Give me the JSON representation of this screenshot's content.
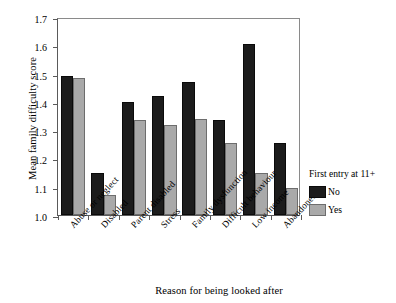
{
  "chart_data": {
    "type": "bar",
    "title": "",
    "xlabel": "Reason for being looked after",
    "ylabel": "Mean family difficulty score",
    "ylim": [
      1.0,
      1.7
    ],
    "yticks": [
      "1.0",
      "1.1",
      "1.2",
      "1.3",
      "1.4",
      "1.5",
      "1.6",
      "1.7"
    ],
    "grid": false,
    "legend_position": "right",
    "legend_title": "First entry at 11+",
    "categories": [
      "Abuse or neglect",
      "Disabled",
      "Parent disabled",
      "Stress",
      "Family dysfunction",
      "Difficult behaviour",
      "Low income",
      "Abandoned"
    ],
    "series": [
      {
        "name": "No",
        "color": "#1c1c1c",
        "values": [
          1.49,
          1.15,
          1.4,
          1.42,
          1.47,
          1.335,
          1.605,
          1.255
        ]
      },
      {
        "name": "Yes",
        "color": "#a9a9a9",
        "values": [
          1.485,
          1.07,
          1.335,
          1.32,
          1.34,
          1.255,
          1.15,
          1.095
        ]
      }
    ]
  },
  "legend": {
    "title": "First entry at 11+",
    "entries": [
      {
        "label": "No",
        "swatch": "no"
      },
      {
        "label": "Yes",
        "swatch": "yes"
      }
    ]
  },
  "axes": {
    "y_title": "Mean family difficulty score",
    "x_title": "Reason for being looked after"
  }
}
